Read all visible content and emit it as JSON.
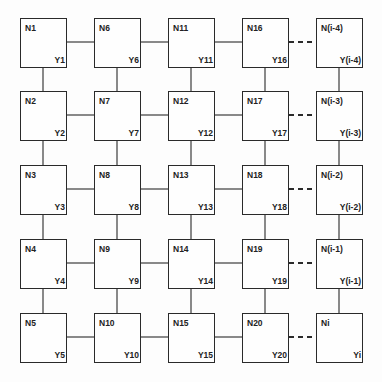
{
  "diagram": {
    "type": "grid-network",
    "columns": 5,
    "rows": 5,
    "nodes": [
      {
        "n": "N1",
        "y": "Y1",
        "col": 0,
        "row": 0
      },
      {
        "n": "N2",
        "y": "Y2",
        "col": 0,
        "row": 1
      },
      {
        "n": "N3",
        "y": "Y3",
        "col": 0,
        "row": 2
      },
      {
        "n": "N4",
        "y": "Y4",
        "col": 0,
        "row": 3
      },
      {
        "n": "N5",
        "y": "Y5",
        "col": 0,
        "row": 4
      },
      {
        "n": "N6",
        "y": "Y6",
        "col": 1,
        "row": 0
      },
      {
        "n": "N7",
        "y": "Y7",
        "col": 1,
        "row": 1
      },
      {
        "n": "N8",
        "y": "Y8",
        "col": 1,
        "row": 2
      },
      {
        "n": "N9",
        "y": "Y9",
        "col": 1,
        "row": 3
      },
      {
        "n": "N10",
        "y": "Y10",
        "col": 1,
        "row": 4
      },
      {
        "n": "N11",
        "y": "Y11",
        "col": 2,
        "row": 0
      },
      {
        "n": "N12",
        "y": "Y12",
        "col": 2,
        "row": 1
      },
      {
        "n": "N13",
        "y": "Y13",
        "col": 2,
        "row": 2
      },
      {
        "n": "N14",
        "y": "Y14",
        "col": 2,
        "row": 3
      },
      {
        "n": "N15",
        "y": "Y15",
        "col": 2,
        "row": 4
      },
      {
        "n": "N16",
        "y": "Y16",
        "col": 3,
        "row": 0
      },
      {
        "n": "N17",
        "y": "Y17",
        "col": 3,
        "row": 1
      },
      {
        "n": "N18",
        "y": "Y18",
        "col": 3,
        "row": 2
      },
      {
        "n": "N19",
        "y": "Y19",
        "col": 3,
        "row": 3
      },
      {
        "n": "N20",
        "y": "Y20",
        "col": 3,
        "row": 4
      },
      {
        "n": "N(i-4)",
        "y": "Y(i-4)",
        "col": 4,
        "row": 0
      },
      {
        "n": "N(i-3)",
        "y": "Y(i-3)",
        "col": 4,
        "row": 1
      },
      {
        "n": "N(i-2)",
        "y": "Y(i-2)",
        "col": 4,
        "row": 2
      },
      {
        "n": "N(i-1)",
        "y": "Y(i-1)",
        "col": 4,
        "row": 3
      },
      {
        "n": "Ni",
        "y": "Yi",
        "col": 4,
        "row": 4
      }
    ],
    "connections": {
      "vertical": "solid lines between vertically adjacent nodes in each column",
      "horizontal_solid": "between columns 0-1, 1-2, 2-3",
      "horizontal_dashed": "between columns 3-4"
    }
  }
}
